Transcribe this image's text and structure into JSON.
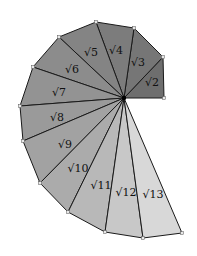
{
  "diagram": {
    "center": [
      124,
      98
    ],
    "vertices": [
      [
        164,
        98
      ],
      [
        163,
        57
      ],
      [
        134,
        28
      ],
      [
        96,
        22
      ],
      [
        59,
        37
      ],
      [
        33,
        67
      ],
      [
        20,
        106
      ],
      [
        23,
        141
      ],
      [
        40,
        183
      ],
      [
        68,
        212
      ],
      [
        105,
        232
      ],
      [
        143,
        238
      ],
      [
        182,
        233
      ]
    ],
    "fills": [
      "#6e6e6e",
      "#767676",
      "#7c7c7c",
      "#848484",
      "#8c8c8c",
      "#939393",
      "#9a9a9a",
      "#a2a2a2",
      "#ababab",
      "#b8b8b8",
      "#c8c8c8",
      "#d8d8d8"
    ],
    "labels": [
      {
        "text": "√2",
        "x": 152,
        "y": 86
      },
      {
        "text": "√3",
        "x": 138,
        "y": 66
      },
      {
        "text": "√4",
        "x": 116,
        "y": 54
      },
      {
        "text": "√5",
        "x": 91,
        "y": 56
      },
      {
        "text": "√6",
        "x": 72,
        "y": 73
      },
      {
        "text": "√7",
        "x": 59,
        "y": 96
      },
      {
        "text": "√8",
        "x": 57,
        "y": 121
      },
      {
        "text": "√9",
        "x": 65,
        "y": 148
      },
      {
        "text": "√10",
        "x": 78,
        "y": 172
      },
      {
        "text": "√11",
        "x": 101,
        "y": 189
      },
      {
        "text": "√12",
        "x": 126,
        "y": 196
      },
      {
        "text": "√13",
        "x": 153,
        "y": 198
      }
    ]
  }
}
